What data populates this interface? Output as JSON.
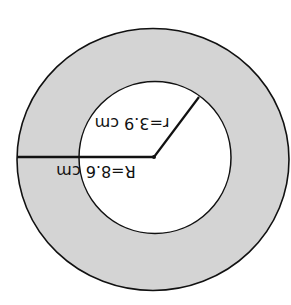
{
  "diagram": {
    "type": "annulus",
    "orientation": "rotated-180",
    "outer_circle": {
      "label": "R=8.6 cm",
      "radius_value": 8.6,
      "unit": "cm"
    },
    "inner_circle": {
      "label": "r=3.9 cm",
      "radius_value": 3.9,
      "unit": "cm"
    },
    "colors": {
      "ring_fill": "#d4d4d4",
      "inner_fill": "#ffffff",
      "stroke": "#111111",
      "background": "#ffffff"
    }
  }
}
